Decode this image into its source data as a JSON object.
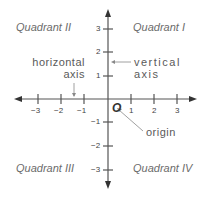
{
  "quadrants": {
    "q1": "Quadrant I",
    "q2": "Quadrant II",
    "q3": "Quadrant III",
    "q4": "Quadrant IV"
  },
  "labels": {
    "horizontal_line1": "horizontal",
    "horizontal_line2": "axis",
    "vertical_line1": "vertical",
    "vertical_line2": "axis",
    "origin_symbol": "O",
    "origin_label": "origin"
  },
  "x_ticks": [
    "−3",
    "−2",
    "−1",
    "1",
    "2",
    "3"
  ],
  "y_ticks": [
    "3",
    "2",
    "1",
    "−1",
    "−2",
    "−3"
  ],
  "colors": {
    "axis": "#555555",
    "text": "#5a5a5a"
  }
}
